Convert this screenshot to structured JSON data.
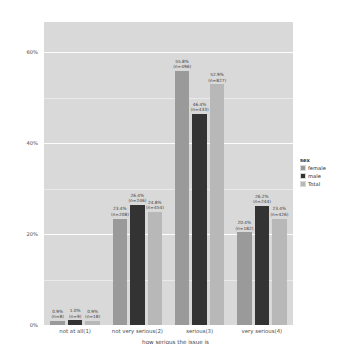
{
  "chart_data": {
    "type": "bar",
    "title": "",
    "xlabel": "how serious the issue is",
    "ylabel": "",
    "categories": [
      "not at all(1)",
      "not very serious(2)",
      "serious(3)",
      "very serious(4)"
    ],
    "series": [
      {
        "name": "female",
        "color": "#9a9a9a",
        "values": [
          0.9,
          23.4,
          55.8,
          20.4
        ],
        "labels": [
          "0.9%",
          "23.4%",
          "55.8%",
          "20.4%"
        ],
        "counts": [
          "(n=8)",
          "(n=208)",
          "(n=496)",
          "(n=182)"
        ]
      },
      {
        "name": "male",
        "color": "#333333",
        "values": [
          1.0,
          26.4,
          46.4,
          26.2
        ],
        "labels": [
          "1.0%",
          "26.4%",
          "46.4%",
          "26.2%"
        ],
        "counts": [
          "(n=9)",
          "(n=246)",
          "(n=433)",
          "(n=244)"
        ]
      },
      {
        "name": "Total",
        "color": "#b8b8b8",
        "values": [
          0.9,
          24.8,
          52.9,
          23.4
        ],
        "labels": [
          "0.9%",
          "24.8%",
          "52.9%",
          "23.4%"
        ],
        "counts": [
          "(n=18)",
          "(n=454)",
          "(n=827)",
          "(n=426)"
        ]
      }
    ],
    "yticks": [
      "0%",
      "20%",
      "40%",
      "60%"
    ],
    "ytick_values": [
      0,
      20,
      40,
      60
    ],
    "ylim": [
      0,
      66.6
    ],
    "grid": true,
    "legend": {
      "title": "sex",
      "position": "right",
      "entries": [
        {
          "label": "female",
          "color": "#9a9a9a"
        },
        {
          "label": "male",
          "color": "#333333"
        },
        {
          "label": "Total",
          "color": "#b8b8b8"
        }
      ]
    },
    "panel_background": "#d9d9d9",
    "gridline_color": "#ffffff"
  }
}
